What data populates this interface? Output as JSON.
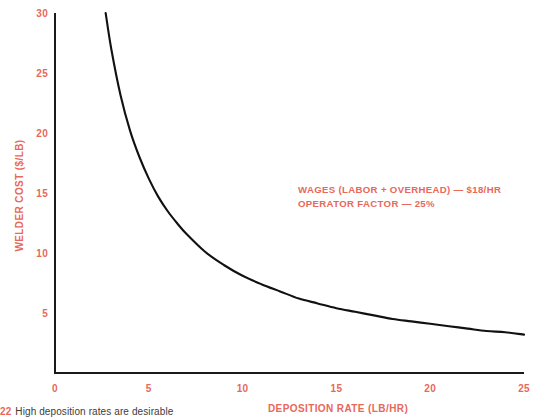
{
  "chart_data": {
    "type": "line",
    "title": "",
    "xlabel": "DEPOSITION RATE (LB/HR)",
    "ylabel": "WELDER COST ($/LB)",
    "xlim": [
      0,
      25
    ],
    "ylim": [
      0,
      30
    ],
    "xticks": [
      0,
      5,
      10,
      15,
      20,
      25
    ],
    "yticks": [
      5,
      10,
      15,
      20,
      25,
      30
    ],
    "xtick_labels": [
      "0",
      "5",
      "10",
      "15",
      "20",
      "25"
    ],
    "ytick_labels": [
      "5",
      "10",
      "15",
      "20",
      "25",
      "30"
    ],
    "grid": false,
    "legend": "none",
    "series": [
      {
        "name": "Welder cost",
        "color": "#111111",
        "x": [
          2.7,
          3.0,
          3.5,
          4.0,
          4.5,
          5.0,
          5.5,
          6.0,
          6.5,
          7.0,
          8.0,
          9.0,
          10.0,
          11.0,
          12.0,
          13.0,
          14.0,
          15.0,
          16.0,
          17.0,
          18.0,
          19.0,
          20.0,
          21.0,
          22.0,
          23.0,
          24.0,
          25.0
        ],
        "y": [
          30.0,
          27.0,
          23.1,
          20.2,
          18.0,
          16.2,
          14.7,
          13.5,
          12.5,
          11.6,
          10.1,
          9.0,
          8.1,
          7.4,
          6.8,
          6.2,
          5.8,
          5.4,
          5.1,
          4.8,
          4.5,
          4.3,
          4.1,
          3.9,
          3.7,
          3.5,
          3.4,
          3.2
        ]
      }
    ],
    "annotations": [
      "WAGES (LABOR + OVERHEAD) — $18/HR",
      "OPERATOR FACTOR — 25%"
    ],
    "colors": {
      "label": "#e8685a",
      "curve": "#111111",
      "axis": "#1a1a1a"
    }
  },
  "caption": {
    "number": "22",
    "text": "High deposition rates are desirable"
  }
}
